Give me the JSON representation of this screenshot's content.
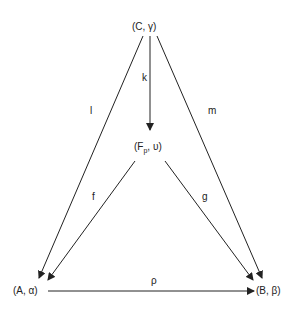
{
  "nodes": {
    "C": {
      "label": "(C, γ)"
    },
    "F": {
      "label_prefix": "(F",
      "label_sub": "p",
      "label_suffix": ", υ)"
    },
    "A": {
      "label": "(A, α)"
    },
    "B": {
      "label": "(B, β)"
    }
  },
  "edges": {
    "k": {
      "label": "k",
      "from": "C",
      "to": "F"
    },
    "l": {
      "label": "l",
      "from": "C",
      "to": "A"
    },
    "m": {
      "label": "m",
      "from": "C",
      "to": "B"
    },
    "f": {
      "label": "f",
      "from": "F",
      "to": "A"
    },
    "g": {
      "label": "g",
      "from": "F",
      "to": "B"
    },
    "rho": {
      "label": "ρ",
      "from": "A",
      "to": "B"
    }
  }
}
